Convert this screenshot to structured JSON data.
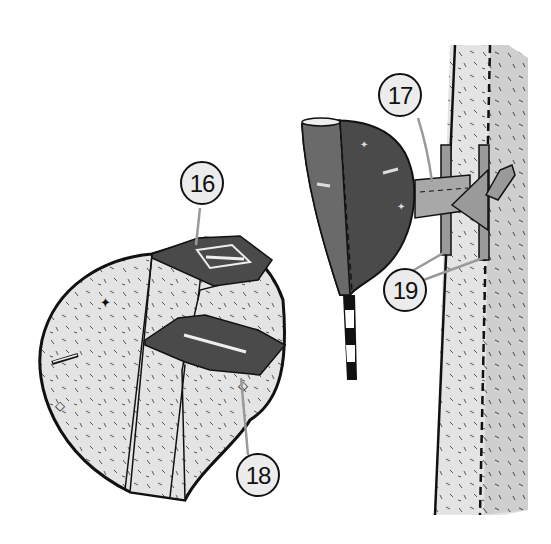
{
  "diagram": {
    "type": "assembly-illustration",
    "style": "black-and-white line drawing with halftone shading",
    "colors": {
      "background": "#ffffff",
      "outline": "#111111",
      "dark_part": "#4a4a4a",
      "mid_part": "#8a8a8a",
      "light_texture": "#dcdcdc",
      "post": "#e2e2e2",
      "post_shadow": "#c9c9c9",
      "callout_fill": "#ececec",
      "leader_line": "#9a9a9a"
    },
    "callouts": [
      {
        "id": "16",
        "label": "16",
        "points_to": "bracket arm joining dome to post"
      },
      {
        "id": "17",
        "label": "17",
        "points_to": "upper slotted plate on open shell"
      },
      {
        "id": "18",
        "label": "18",
        "points_to": "lower slotted plate inside open shell"
      },
      {
        "id": "19",
        "label": "19",
        "points_to": "two vertical clamp straps on post"
      }
    ],
    "parts": [
      {
        "name": "open-shell",
        "description": "Half-dome shell shown open with two slotted shelves"
      },
      {
        "name": "closed-dome",
        "description": "Assembled dark half-dome mounted to post"
      },
      {
        "name": "striped-stake",
        "description": "Black and white striped stake below dome"
      },
      {
        "name": "post",
        "description": "Vertical textured post with dashed seam"
      },
      {
        "name": "bracket",
        "description": "Horizontal arm with triangular clamp and Y-shaped tip"
      }
    ]
  }
}
